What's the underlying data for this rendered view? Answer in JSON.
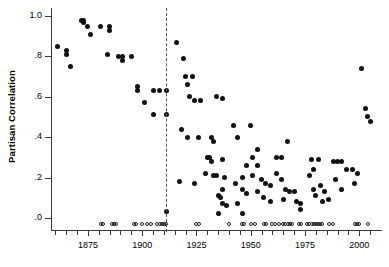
{
  "chart_data": {
    "type": "scatter",
    "title": "",
    "xlabel": "",
    "ylabel": "Partisan Correlation",
    "xlim": [
      1858,
      2010
    ],
    "ylim": [
      -0.06,
      1.04
    ],
    "grid": false,
    "legend": null,
    "y_ticks": [
      {
        "value": 1.0,
        "label": "1.0"
      },
      {
        "value": 0.8,
        "label": ".8"
      },
      {
        "value": 0.6,
        "label": ".6"
      },
      {
        "value": 0.4,
        "label": ".4"
      },
      {
        "value": 0.2,
        "label": ".2"
      },
      {
        "value": 0.0,
        "label": ".0"
      }
    ],
    "x_ticks_major": [
      {
        "value": 1875,
        "label": "1875"
      },
      {
        "value": 1900,
        "label": "1900"
      },
      {
        "value": 1925,
        "label": "1925"
      },
      {
        "value": 1950,
        "label": "1950"
      },
      {
        "value": 1975,
        "label": "1975"
      },
      {
        "value": 2000,
        "label": "2000"
      }
    ],
    "x_ticks_minor": [
      1860,
      1865,
      1870,
      1880,
      1885,
      1890,
      1895,
      1905,
      1910,
      1915,
      1920,
      1930,
      1935,
      1940,
      1945,
      1955,
      1960,
      1965,
      1970,
      1980,
      1985,
      1990,
      1995,
      2005
    ],
    "annotations": [
      {
        "type": "vline",
        "style": "dashed",
        "x": 1911,
        "label": ""
      }
    ],
    "series": [
      {
        "name": "Partisan Correlation",
        "marker": "filled-circle",
        "color": "#111111",
        "points": [
          [
            1861,
            0.85
          ],
          [
            1865,
            0.83
          ],
          [
            1865,
            0.81
          ],
          [
            1867,
            0.75
          ],
          [
            1872,
            0.98
          ],
          [
            1873,
            0.98
          ],
          [
            1873,
            0.97
          ],
          [
            1875,
            0.95
          ],
          [
            1876,
            0.91
          ],
          [
            1881,
            0.95
          ],
          [
            1885,
            0.95
          ],
          [
            1885,
            0.93
          ],
          [
            1884,
            0.81
          ],
          [
            1889,
            0.8
          ],
          [
            1891,
            0.8
          ],
          [
            1891,
            0.78
          ],
          [
            1895,
            0.8
          ],
          [
            1898,
            0.65
          ],
          [
            1898,
            0.63
          ],
          [
            1901,
            0.57
          ],
          [
            1905,
            0.63
          ],
          [
            1905,
            0.51
          ],
          [
            1908,
            0.63
          ],
          [
            1911,
            0.63
          ],
          [
            1911,
            0.51
          ],
          [
            1916,
            0.87
          ],
          [
            1919,
            0.79
          ],
          [
            1920,
            0.7
          ],
          [
            1923,
            0.7
          ],
          [
            1921,
            0.66
          ],
          [
            1922,
            0.6
          ],
          [
            1924,
            0.58
          ],
          [
            1927,
            0.58
          ],
          [
            1934,
            0.6
          ],
          [
            1937,
            0.59
          ],
          [
            1918,
            0.44
          ],
          [
            1921,
            0.4
          ],
          [
            1926,
            0.4
          ],
          [
            1930,
            0.3
          ],
          [
            1932,
            0.4
          ],
          [
            1933,
            0.38
          ],
          [
            1931,
            0.3
          ],
          [
            1932,
            0.28
          ],
          [
            1937,
            0.29
          ],
          [
            1929,
            0.22
          ],
          [
            1933,
            0.21
          ],
          [
            1934,
            0.21
          ],
          [
            1938,
            0.2
          ],
          [
            1917,
            0.18
          ],
          [
            1924,
            0.17
          ],
          [
            1937,
            0.14
          ],
          [
            1935,
            0.11
          ],
          [
            1936,
            0.1
          ],
          [
            1937,
            0.07
          ],
          [
            1939,
            0.06
          ],
          [
            1911,
            0.03
          ],
          [
            1935,
            0.02
          ],
          [
            1942,
            0.46
          ],
          [
            1944,
            0.4
          ],
          [
            1948,
            0.26
          ],
          [
            1946,
            0.2
          ],
          [
            1943,
            0.17
          ],
          [
            1946,
            0.14
          ],
          [
            1948,
            0.12
          ],
          [
            1944,
            0.07
          ],
          [
            1946,
            0.02
          ],
          [
            1950,
            0.46
          ],
          [
            1953,
            0.34
          ],
          [
            1951,
            0.3
          ],
          [
            1953,
            0.26
          ],
          [
            1951,
            0.21
          ],
          [
            1955,
            0.19
          ],
          [
            1957,
            0.17
          ],
          [
            1959,
            0.16
          ],
          [
            1953,
            0.13
          ],
          [
            1956,
            0.1
          ],
          [
            1959,
            0.08
          ],
          [
            1962,
            0.3
          ],
          [
            1964,
            0.3
          ],
          [
            1967,
            0.38
          ],
          [
            1962,
            0.22
          ],
          [
            1964,
            0.19
          ],
          [
            1966,
            0.14
          ],
          [
            1968,
            0.13
          ],
          [
            1970,
            0.13
          ],
          [
            1965,
            0.09
          ],
          [
            1971,
            0.08
          ],
          [
            1973,
            0.07
          ],
          [
            1973,
            0.04
          ],
          [
            1978,
            0.29
          ],
          [
            1981,
            0.29
          ],
          [
            1979,
            0.24
          ],
          [
            1977,
            0.21
          ],
          [
            1982,
            0.16
          ],
          [
            1979,
            0.14
          ],
          [
            1984,
            0.13
          ],
          [
            1980,
            0.11
          ],
          [
            1983,
            0.08
          ],
          [
            1986,
            0.09
          ],
          [
            1988,
            0.28
          ],
          [
            1990,
            0.28
          ],
          [
            1992,
            0.28
          ],
          [
            1989,
            0.19
          ],
          [
            1994,
            0.24
          ],
          [
            1997,
            0.24
          ],
          [
            1999,
            0.22
          ],
          [
            1992,
            0.14
          ],
          [
            1998,
            0.17
          ],
          [
            2001,
            0.74
          ],
          [
            2003,
            0.54
          ],
          [
            2004,
            0.5
          ],
          [
            2005,
            0.48
          ]
        ]
      },
      {
        "name": "Observation markers",
        "marker": "open-circle",
        "color": "#222222",
        "y": 0.0,
        "x_values": [
          1881,
          1882,
          1886,
          1887,
          1888,
          1896,
          1897,
          1900,
          1902,
          1904,
          1907,
          1908,
          1909,
          1910,
          1911,
          1925,
          1926,
          1940,
          1946,
          1947,
          1950,
          1952,
          1956,
          1957,
          1960,
          1961,
          1963,
          1965,
          1966,
          1967,
          1968,
          1969,
          1972,
          1973,
          1976,
          1977,
          1978,
          1979,
          1980,
          1981,
          1982,
          1983,
          1986,
          1988,
          1998,
          1999,
          2000,
          2004
        ]
      }
    ]
  }
}
